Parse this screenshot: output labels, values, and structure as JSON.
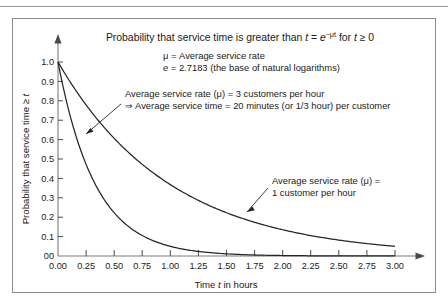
{
  "figure": {
    "title_plain": "Probability that service time is greater than t = e^(-μt) for t ≥ 0",
    "title_part1": "Probability that service time is greater than ",
    "title_var_t": "t",
    "title_eq": " = ",
    "title_e": "e",
    "title_exp": "−μt",
    "title_for": " for ",
    "title_var_t2": "t",
    "title_cond": " ≥ 0"
  },
  "legend_notes": {
    "mu_def": "μ = Average service rate",
    "e_def_var": "e",
    "e_def_rest": " = 2.7183 (the base of natural logarithms)"
  },
  "annotations": [
    {
      "id": "mu3",
      "line1": "Average service rate (μ) = 3 customers per hour",
      "line2": "⇒ Average service time = 20 minutes (or 1/3 hour) per customer",
      "points_to_series": "mu-3"
    },
    {
      "id": "mu1",
      "line1": "Average service rate (μ) =",
      "line2": "1 customer per hour",
      "points_to_series": "mu-1"
    }
  ],
  "axes": {
    "x_title_pre": "Time ",
    "x_title_var": "t",
    "x_title_post": " in hours",
    "y_title": "Probability that service time ≥ t",
    "y_title_pre": "Probability that service time ≥ ",
    "y_title_var": "t",
    "x_origin_label": "00",
    "y_origin_label": "00"
  },
  "chart_data": {
    "type": "line",
    "xlabel": "Time t in hours",
    "ylabel": "Probability that service time ≥ t",
    "xlim": [
      0,
      3.0
    ],
    "ylim": [
      0,
      1.0
    ],
    "grid": false,
    "legend_position": "annotations-inline",
    "xticks": [
      0.0,
      0.25,
      0.5,
      0.75,
      1.0,
      1.25,
      1.5,
      1.75,
      2.0,
      2.25,
      2.5,
      2.75,
      3.0
    ],
    "xtick_labels": [
      "0.00",
      "0.25",
      "0.50",
      "0.75",
      "1.00",
      "1.25",
      "1.50",
      "1.75",
      "2.00",
      "2.25",
      "2.50",
      "2.75",
      "3.00"
    ],
    "yticks": [
      0.0,
      0.1,
      0.2,
      0.3,
      0.4,
      0.5,
      0.6,
      0.7,
      0.8,
      0.9,
      1.0
    ],
    "ytick_labels": [
      "0.0",
      "0.1",
      "0.2",
      "0.3",
      "0.4",
      "0.5",
      "0.6",
      "0.7",
      "0.8",
      "0.9",
      "1.0"
    ],
    "series": [
      {
        "name": "Average service rate (μ) = 1 customer per hour",
        "mu": 1,
        "formula": "y = e^(-1t)",
        "x": [
          0.0,
          0.25,
          0.5,
          0.75,
          1.0,
          1.25,
          1.5,
          1.75,
          2.0,
          2.25,
          2.5,
          2.75,
          3.0
        ],
        "values": [
          1.0,
          0.779,
          0.607,
          0.472,
          0.368,
          0.287,
          0.223,
          0.174,
          0.135,
          0.105,
          0.082,
          0.064,
          0.05
        ]
      },
      {
        "name": "Average service rate (μ) = 3 customers per hour",
        "mu": 3,
        "formula": "y = e^(-3t)",
        "x": [
          0.0,
          0.25,
          0.5,
          0.75,
          1.0,
          1.25,
          1.5,
          1.75,
          2.0,
          2.25,
          2.5,
          2.75,
          3.0
        ],
        "values": [
          1.0,
          0.472,
          0.223,
          0.105,
          0.05,
          0.024,
          0.011,
          0.005,
          0.002,
          0.001,
          0.001,
          0.0,
          0.0
        ]
      }
    ]
  },
  "colors": {
    "curve": "#262626",
    "axis": "#7d7d7d",
    "text": "#1a1a1a",
    "frame": "#8c8c8c",
    "background": "#ffffff"
  }
}
